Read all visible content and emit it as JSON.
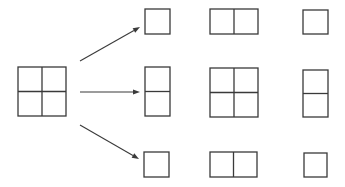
{
  "canvas": {
    "width": 345,
    "height": 187,
    "background": "#ffffff"
  },
  "colors": {
    "stroke": "#3a3a3a",
    "fill": "#ffffff"
  },
  "source": {
    "name": "source-grid-2x2",
    "x": 18,
    "y": 67,
    "w": 48,
    "h": 49,
    "grid": [
      2,
      2
    ]
  },
  "arrows": [
    {
      "name": "arrow-to-top-row",
      "x1": 80,
      "y1": 61,
      "x2": 140,
      "y2": 27
    },
    {
      "name": "arrow-to-middle-row",
      "x1": 80,
      "y1": 92,
      "x2": 140,
      "y2": 92
    },
    {
      "name": "arrow-to-bottom-row",
      "x1": 80,
      "y1": 125,
      "x2": 139,
      "y2": 159
    }
  ],
  "rows": [
    {
      "name": "top-row",
      "boxes": [
        {
          "name": "top-left-box",
          "x": 145,
          "y": 9,
          "w": 25,
          "h": 25,
          "grid": [
            1,
            1
          ]
        },
        {
          "name": "top-center-box",
          "x": 210,
          "y": 9,
          "w": 48,
          "h": 25,
          "grid": [
            2,
            1
          ]
        },
        {
          "name": "top-right-box",
          "x": 303,
          "y": 10,
          "w": 25,
          "h": 24,
          "grid": [
            1,
            1
          ]
        }
      ]
    },
    {
      "name": "middle-row",
      "boxes": [
        {
          "name": "middle-left-box",
          "x": 145,
          "y": 67,
          "w": 25,
          "h": 49,
          "grid": [
            1,
            2
          ]
        },
        {
          "name": "middle-center-box",
          "x": 210,
          "y": 68,
          "w": 48,
          "h": 49,
          "grid": [
            2,
            2
          ]
        },
        {
          "name": "middle-right-box",
          "x": 303,
          "y": 70,
          "w": 25,
          "h": 47,
          "grid": [
            1,
            2
          ]
        }
      ]
    },
    {
      "name": "bottom-row",
      "boxes": [
        {
          "name": "bottom-left-box",
          "x": 144,
          "y": 152,
          "w": 25,
          "h": 25,
          "grid": [
            1,
            1
          ]
        },
        {
          "name": "bottom-center-box",
          "x": 210,
          "y": 152,
          "w": 47,
          "h": 25,
          "grid": [
            2,
            1
          ]
        },
        {
          "name": "bottom-right-box",
          "x": 304,
          "y": 153,
          "w": 23,
          "h": 24,
          "grid": [
            1,
            1
          ]
        }
      ]
    }
  ]
}
